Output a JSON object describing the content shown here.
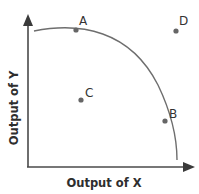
{
  "diagram": {
    "type": "production-possibilities-frontier",
    "x_axis": {
      "label": "Output of X"
    },
    "y_axis": {
      "label": "Output of Y"
    },
    "curve": {
      "name": "production possibilities frontier",
      "shape": "concave (bowed outward)",
      "color": "#6e6e6e"
    },
    "points": [
      {
        "id": "A",
        "label": "A",
        "position": "on curve, high Y / low X"
      },
      {
        "id": "B",
        "label": "B",
        "position": "on curve, high X / low Y"
      },
      {
        "id": "C",
        "label": "C",
        "position": "inside curve (inefficient)"
      },
      {
        "id": "D",
        "label": "D",
        "position": "outside curve (unattainable)"
      }
    ],
    "colors": {
      "axis": "#4a4a4a",
      "curve": "#6e6e6e",
      "point": "#666666",
      "text": "#333333",
      "background": "#ffffff"
    }
  }
}
